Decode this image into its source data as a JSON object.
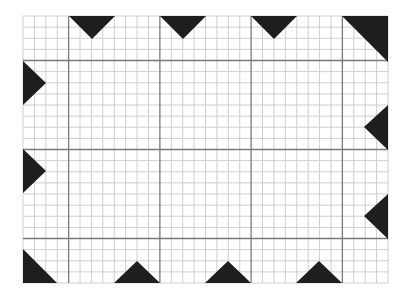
{
  "diagram": {
    "colors": {
      "background": "#ffffff",
      "minor_line": "#cfcfcf",
      "major_line": "#7a7a7a",
      "triangle_fill": "#1e1e1e"
    },
    "grid": {
      "left": 23,
      "top": 16,
      "right": 388,
      "bottom": 283,
      "cols": 32,
      "rows": 24,
      "major_cols": [
        4,
        12,
        20,
        28
      ],
      "major_rows": [
        4,
        12,
        20
      ]
    },
    "triangles": [
      {
        "name": "top-triangle-1",
        "points": [
          [
            69,
            16
          ],
          [
            115,
            16
          ],
          [
            92,
            39
          ]
        ]
      },
      {
        "name": "top-triangle-2",
        "points": [
          [
            160,
            16
          ],
          [
            206,
            16
          ],
          [
            183,
            39
          ]
        ]
      },
      {
        "name": "top-triangle-3",
        "points": [
          [
            251,
            16
          ],
          [
            297,
            16
          ],
          [
            274,
            39
          ]
        ]
      },
      {
        "name": "top-right-corner-triangle",
        "points": [
          [
            342,
            16
          ],
          [
            388,
            16
          ],
          [
            388,
            62
          ]
        ]
      },
      {
        "name": "left-triangle-1",
        "points": [
          [
            23,
            61
          ],
          [
            23,
            105
          ],
          [
            46,
            83
          ]
        ]
      },
      {
        "name": "left-triangle-2",
        "points": [
          [
            23,
            149
          ],
          [
            23,
            193
          ],
          [
            46,
            171
          ]
        ]
      },
      {
        "name": "right-triangle-1",
        "points": [
          [
            388,
            105
          ],
          [
            388,
            150
          ],
          [
            364,
            127
          ]
        ]
      },
      {
        "name": "right-triangle-2",
        "points": [
          [
            388,
            194
          ],
          [
            388,
            239
          ],
          [
            364,
            216
          ]
        ]
      },
      {
        "name": "bottom-left-corner-triangle",
        "points": [
          [
            23,
            249
          ],
          [
            23,
            283
          ],
          [
            57,
            283
          ]
        ]
      },
      {
        "name": "bottom-triangle-1",
        "points": [
          [
            114,
            283
          ],
          [
            160,
            283
          ],
          [
            137,
            261
          ]
        ]
      },
      {
        "name": "bottom-triangle-2",
        "points": [
          [
            205,
            283
          ],
          [
            251,
            283
          ],
          [
            228,
            261
          ]
        ]
      },
      {
        "name": "bottom-triangle-3",
        "points": [
          [
            296,
            283
          ],
          [
            342,
            283
          ],
          [
            319,
            261
          ]
        ]
      }
    ]
  }
}
